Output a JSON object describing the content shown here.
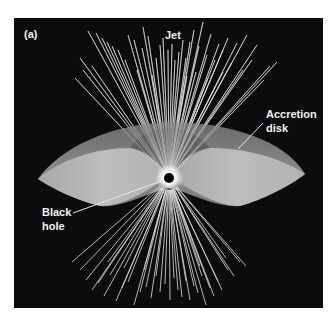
{
  "figure": {
    "panel_label": "(a)",
    "background": "#0c0c0c",
    "panel_box": {
      "x": 14,
      "y": 18,
      "w": 309,
      "h": 290
    },
    "center": {
      "x": 169,
      "y": 178
    },
    "colors": {
      "disk_rim": "#7c7c7c",
      "disk_inner": "#b4b4b4",
      "disk_shadow": "#5a5a5a",
      "jet": "#dcdcdc",
      "label": "#f2f2f2",
      "black_hole": "#000000",
      "glow": "#ffffff"
    },
    "labels": {
      "jet": "Jet",
      "accretion_line1": "Accretion",
      "accretion_line2": "disk",
      "black_line1": "Black",
      "black_line2": "hole"
    },
    "upper_jet_endpoints": [
      [
        88,
        31
      ],
      [
        96,
        33
      ],
      [
        102,
        38
      ],
      [
        107,
        42
      ],
      [
        112,
        46
      ],
      [
        118,
        50
      ],
      [
        80,
        58
      ],
      [
        75,
        78
      ],
      [
        83,
        70
      ],
      [
        92,
        66
      ],
      [
        128,
        35
      ],
      [
        134,
        40
      ],
      [
        142,
        48
      ],
      [
        148,
        36
      ],
      [
        156,
        58
      ],
      [
        143,
        27
      ],
      [
        160,
        45
      ],
      [
        163,
        38
      ],
      [
        168,
        50
      ],
      [
        172,
        44
      ],
      [
        175,
        60
      ],
      [
        179,
        52
      ],
      [
        183,
        40
      ],
      [
        186,
        58
      ],
      [
        190,
        42
      ],
      [
        194,
        30
      ],
      [
        199,
        46
      ],
      [
        203,
        22
      ],
      [
        207,
        55
      ],
      [
        211,
        34
      ],
      [
        215,
        60
      ],
      [
        219,
        44
      ],
      [
        223,
        50
      ],
      [
        228,
        38
      ],
      [
        232,
        62
      ],
      [
        237,
        43
      ],
      [
        243,
        70
      ],
      [
        247,
        35
      ],
      [
        252,
        60
      ],
      [
        257,
        45
      ],
      [
        264,
        80
      ],
      [
        270,
        66
      ],
      [
        277,
        62
      ],
      [
        125,
        60
      ],
      [
        137,
        70
      ],
      [
        152,
        75
      ],
      [
        187,
        76
      ],
      [
        196,
        72
      ],
      [
        223,
        72
      ],
      [
        208,
        78
      ]
    ],
    "lower_jet_endpoints": [
      [
        72,
        262
      ],
      [
        80,
        270
      ],
      [
        86,
        280
      ],
      [
        92,
        290
      ],
      [
        98,
        283
      ],
      [
        104,
        296
      ],
      [
        110,
        275
      ],
      [
        116,
        301
      ],
      [
        122,
        288
      ],
      [
        128,
        282
      ],
      [
        134,
        305
      ],
      [
        140,
        292
      ],
      [
        146,
        287
      ],
      [
        151,
        298
      ],
      [
        156,
        276
      ],
      [
        160,
        292
      ],
      [
        165,
        284
      ],
      [
        170,
        300
      ],
      [
        174,
        278
      ],
      [
        178,
        290
      ],
      [
        182,
        297
      ],
      [
        186,
        281
      ],
      [
        190,
        300
      ],
      [
        194,
        286
      ],
      [
        198,
        293
      ],
      [
        202,
        276
      ],
      [
        206,
        305
      ],
      [
        210,
        288
      ],
      [
        214,
        296
      ],
      [
        218,
        281
      ],
      [
        222,
        290
      ],
      [
        228,
        270
      ],
      [
        234,
        276
      ],
      [
        240,
        262
      ],
      [
        246,
        266
      ],
      [
        108,
        262
      ],
      [
        124,
        268
      ],
      [
        144,
        270
      ],
      [
        200,
        266
      ],
      [
        226,
        258
      ]
    ],
    "leaders": {
      "accretion": {
        "x1": 263,
        "y1": 123,
        "x2": 238,
        "y2": 149
      },
      "black_hole": {
        "x1": 73,
        "y1": 213,
        "x2": 164,
        "y2": 180
      },
      "jet": {
        "x1": 161,
        "y1": 33,
        "x2": 161,
        "y2": 48
      }
    }
  }
}
